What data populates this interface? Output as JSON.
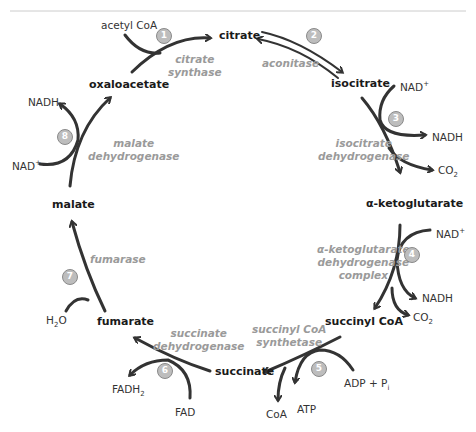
{
  "metabolites": {
    "citrate": "citrate",
    "isocitrate": "isocitrate",
    "alpha_ketoglutarate": "α-ketoglutarate",
    "succinyl_coa": "succinyl CoA",
    "succinate": "succinate",
    "fumarate": "fumarate",
    "malate": "malate",
    "oxaloacetate": "oxaloacetate"
  },
  "cofactors": {
    "acetyl_coa": "acetyl CoA",
    "nad_3": "NAD",
    "nadh_3": "NADH",
    "co2_3": "CO",
    "nad_4": "NAD",
    "nadh_4": "NADH",
    "co2_4": "CO",
    "adp_pi": "ADP + P",
    "atp": "ATP",
    "coa": "CoA",
    "fad": "FAD",
    "fadh2": "FADH",
    "h2o_h": "H",
    "h2o_o": "O",
    "nad_8": "NAD",
    "nadh_8": "NADH",
    "plus": "+",
    "sub2": "2",
    "subi": "i"
  },
  "enzymes": {
    "e1_line1": "citrate",
    "e1_line2": "synthase",
    "e2": "aconitase",
    "e3_line1": "isocitrate",
    "e3_line2": "dehydrogenase",
    "e4_line1": "α-ketoglutarate",
    "e4_line2": "dehydrogenase",
    "e4_line3": "complex",
    "e5_line1": "succinyl CoA",
    "e5_line2": "synthetase",
    "e6_line1": "succinate",
    "e6_line2": "dehydrogenase",
    "e7": "fumarase",
    "e8_line1": "malate",
    "e8_line2": "dehydrogenase"
  },
  "steps": [
    "1",
    "2",
    "3",
    "4",
    "5",
    "6",
    "7",
    "8"
  ],
  "colors": {
    "arrow": "#333333",
    "enzyme": "#9a9a9a",
    "step_fill": "#bdbdbd",
    "rule": "#cccccc"
  }
}
